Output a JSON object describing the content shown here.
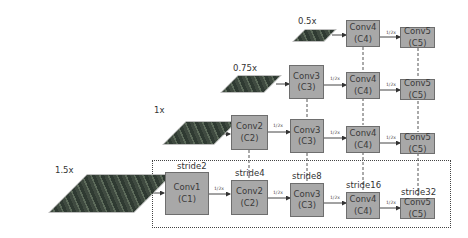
{
  "scales": [
    {
      "label": "0.5x"
    },
    {
      "label": "0.75x"
    },
    {
      "label": "1x"
    },
    {
      "label": "1.5x"
    }
  ],
  "rows": {
    "r05": [
      {
        "name": "Conv4",
        "sub": "(C4)"
      },
      {
        "name": "Conv5",
        "sub": "(C5)"
      }
    ],
    "r075": [
      {
        "name": "Conv3",
        "sub": "(C3)"
      },
      {
        "name": "Conv4",
        "sub": "(C4)"
      },
      {
        "name": "Conv5",
        "sub": "(C5)"
      }
    ],
    "r1": [
      {
        "name": "Conv2",
        "sub": "(C2)"
      },
      {
        "name": "Conv3",
        "sub": "(C3)"
      },
      {
        "name": "Conv4",
        "sub": "(C4)"
      },
      {
        "name": "Conv5",
        "sub": "(C5)"
      }
    ],
    "r15": [
      {
        "name": "Conv1",
        "sub": "(C1)"
      },
      {
        "name": "Conv2",
        "sub": "(C2)"
      },
      {
        "name": "Conv3",
        "sub": "(C3)"
      },
      {
        "name": "Conv4",
        "sub": "(C4)"
      },
      {
        "name": "Conv5",
        "sub": "(C5)"
      }
    ]
  },
  "strides": [
    "stride2",
    "stride4",
    "stride8",
    "stride16",
    "stride32"
  ],
  "downsample_label": "1/2x",
  "colors": {
    "box_fill": "#a8a8a8",
    "box_border": "#6e6e6e",
    "line": "#555555"
  }
}
